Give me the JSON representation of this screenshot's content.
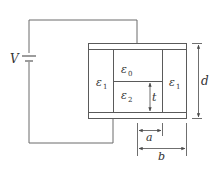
{
  "diagram": {
    "type": "circuit-capacitor-dielectrics",
    "source_label": "V",
    "regions": [
      {
        "id": "left",
        "symbol": "ε",
        "subscript": "1"
      },
      {
        "id": "top-center",
        "symbol": "ε",
        "subscript": "0"
      },
      {
        "id": "bottom-center",
        "symbol": "ε",
        "subscript": "2"
      },
      {
        "id": "right",
        "symbol": "ε",
        "subscript": "1"
      }
    ],
    "dimensions": {
      "plate_separation": "d",
      "lower_height": "t",
      "width_a": "a",
      "width_b": "b"
    }
  },
  "colors": {
    "wire": "#6b6b6b",
    "plate": "#5a5a5a",
    "text": "#333333",
    "background": "#ffffff"
  }
}
